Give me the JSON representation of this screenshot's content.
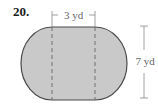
{
  "problem": {
    "number": "20."
  },
  "figure": {
    "shape": "rectangle with two semicircular ends (stadium / oval)",
    "fill_color": "#c8c8c8",
    "stroke_color": "#444444",
    "dimensions": [
      {
        "label": "3 yd",
        "applies_to": "width of middle rectangle (between dashed lines)"
      },
      {
        "label": "7 yd",
        "applies_to": "total height / diameter of semicircles"
      }
    ]
  }
}
